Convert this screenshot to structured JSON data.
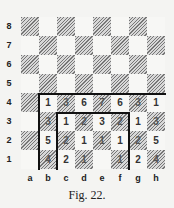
{
  "figure": {
    "caption": "Fig. 22.",
    "files": [
      "a",
      "b",
      "c",
      "d",
      "e",
      "f",
      "g",
      "h"
    ],
    "ranks": [
      "8",
      "7",
      "6",
      "5",
      "4",
      "3",
      "2",
      "1"
    ],
    "board": {
      "rows": [
        {
          "rank": "8",
          "cells": [
            "",
            "",
            "",
            "",
            "",
            "",
            "",
            ""
          ]
        },
        {
          "rank": "7",
          "cells": [
            "",
            "",
            "",
            "",
            "",
            "",
            "",
            ""
          ]
        },
        {
          "rank": "6",
          "cells": [
            "",
            "",
            "",
            "",
            "",
            "",
            "",
            ""
          ]
        },
        {
          "rank": "5",
          "cells": [
            "",
            "",
            "",
            "",
            "",
            "",
            "",
            ""
          ]
        },
        {
          "rank": "4",
          "cells": [
            "",
            "1",
            "3",
            "6",
            "7",
            "6",
            "3",
            "1"
          ]
        },
        {
          "rank": "3",
          "cells": [
            "",
            "3",
            "1",
            "2",
            "3",
            "2",
            "1",
            "3"
          ]
        },
        {
          "rank": "2",
          "cells": [
            "",
            "5",
            "2",
            "1",
            "1",
            "1",
            "2",
            "5"
          ]
        },
        {
          "rank": "1",
          "cells": [
            "",
            "4",
            "2",
            "1",
            "",
            "1",
            "2",
            "4"
          ]
        }
      ]
    },
    "outlined_regions": [
      {
        "name": "outer-region",
        "files": "b-h",
        "ranks": "1-4"
      },
      {
        "name": "inner-region",
        "files": "c-f",
        "ranks": "1-3"
      }
    ]
  }
}
